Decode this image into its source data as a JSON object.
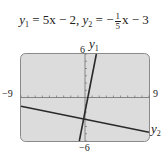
{
  "chart_data": {
    "type": "line",
    "xlabel": "",
    "ylabel": "",
    "xlim": [
      -9,
      9
    ],
    "ylim": [
      -6,
      6
    ],
    "grid": false,
    "tick_labels": {
      "xmin": "−9",
      "xmax": "9",
      "ymin": "−6",
      "ymax": "6"
    },
    "series": [
      {
        "name": "y1",
        "equation": "y = 5x − 2",
        "x": [
          -0.8,
          1.6
        ],
        "y": [
          -6,
          6
        ]
      },
      {
        "name": "y2",
        "equation": "y = −(1/5)x − 3",
        "x": [
          -9,
          9
        ],
        "y": [
          -1.2,
          -4.8
        ]
      }
    ],
    "intersection": {
      "x": 0.19,
      "y": -3.04
    }
  },
  "title": {
    "y1_name": "y",
    "y1_sub": "1",
    "y1_rhs": " = 5x − 2,  ",
    "y2_name": "y",
    "y2_sub": "2",
    "y2_eq": " = −",
    "frac_num": "1",
    "frac_den": "5",
    "y2_tail": "x − 3"
  },
  "labels": {
    "ymax": "6",
    "ymin": "−6",
    "xmin": "−9",
    "xmax": "9",
    "y1_curve_name": "y",
    "y1_curve_sub": "1",
    "y2_curve_name": "y",
    "y2_curve_sub": "2"
  },
  "colors": {
    "screen_bg": "#dcdcdc",
    "screen_border": "#8a8a8a",
    "line": "#2a2a2a",
    "axis": "#6e6e6e"
  }
}
